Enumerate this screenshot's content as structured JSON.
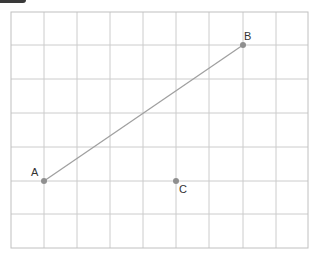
{
  "diagram": {
    "type": "grid-coordinate-plot",
    "grid": {
      "columns": 9,
      "rows": 7,
      "origin_px": [
        11,
        12
      ],
      "cell_w": 33,
      "cell_h": 33.7,
      "line_color": "#c8c8c8",
      "border_color": "#bdbdbd"
    },
    "points": [
      {
        "name": "A",
        "label": "A",
        "grid": [
          1,
          5
        ],
        "color": "#8a8a8a"
      },
      {
        "name": "B",
        "label": "B",
        "grid": [
          7,
          1
        ],
        "color": "#8a8a8a"
      },
      {
        "name": "C",
        "label": "C",
        "grid": [
          5,
          5
        ],
        "color": "#8a8a8a"
      }
    ],
    "segments": [
      {
        "from": "A",
        "to": "B",
        "color": "#9a9a9a"
      }
    ]
  }
}
